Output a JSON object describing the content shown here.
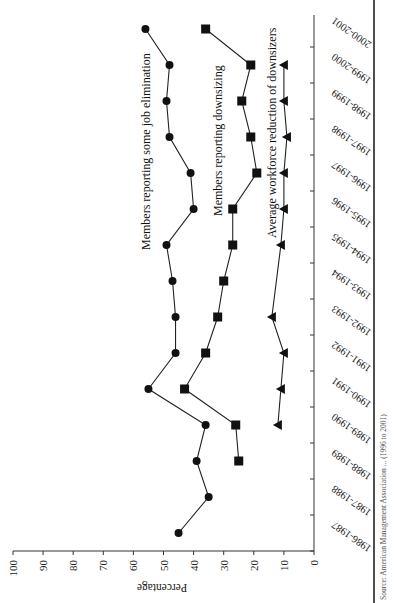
{
  "chart_data": {
    "type": "line",
    "orientation_note": "figure rendered rotated 90 degrees on the page",
    "title": "",
    "xlabel": "",
    "ylabel": "Percentage",
    "ylim": [
      0,
      100
    ],
    "yticks": [
      0,
      10,
      20,
      30,
      40,
      50,
      60,
      70,
      80,
      90,
      100
    ],
    "grid": false,
    "legend_position": "inline labels next to series",
    "categories": [
      "1986-1987",
      "1987-1988",
      "1988-1989",
      "1989-1990",
      "1990-1991",
      "1991-1992",
      "1992-1993",
      "1993-1994",
      "1994-1995",
      "1995-1996",
      "1996-1997",
      "1997-1998",
      "1998-1999",
      "1999-2000",
      "2000-2001"
    ],
    "series": [
      {
        "name": "Members reporting some job elimination",
        "marker": "circle",
        "values": [
          45,
          35,
          39,
          36,
          55,
          46,
          46,
          47,
          49,
          40,
          41,
          48,
          49,
          48,
          56
        ]
      },
      {
        "name": "Members reporting downsizing",
        "marker": "square",
        "values": [
          null,
          null,
          25,
          26,
          43,
          36,
          32,
          30,
          27,
          27,
          19,
          21,
          24,
          21,
          36
        ]
      },
      {
        "name": "Average workforce reduction of  downsizers",
        "marker": "triangle",
        "values": [
          null,
          null,
          null,
          12,
          11,
          10,
          14,
          null,
          11,
          10,
          10,
          9,
          10,
          10,
          null
        ]
      }
    ],
    "source_note": "Source: American Management Association ... (1996 to 2001)"
  },
  "labels": {
    "ylabel": "Percentage",
    "series_1": "Members reporting some job elimination",
    "series_2": "Members reporting downsizing",
    "series_3": "Average workforce reduction of  downsizers",
    "source": "Source: American Management Association ... (1996 to 2001)"
  },
  "colors": {
    "ink": "#222222",
    "background": "#ffffff"
  }
}
